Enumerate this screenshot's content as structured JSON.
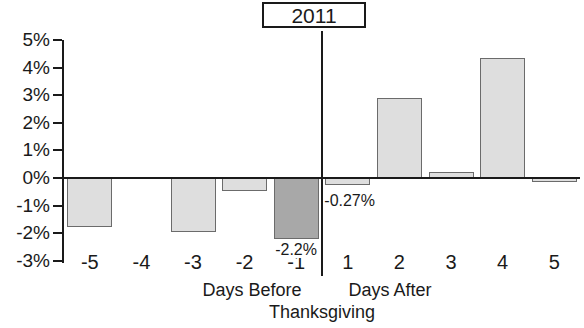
{
  "chart_data": {
    "type": "bar",
    "title": "2011",
    "xlabel": "Days Before Thanksgiving / Days After Thanksgiving",
    "ylabel": "",
    "ylim": [
      -3,
      5
    ],
    "ytick_labels": [
      "5%",
      "4%",
      "3%",
      "2%",
      "1%",
      "0%",
      "-1%",
      "-2%",
      "-3%"
    ],
    "ytick_values": [
      5,
      4,
      3,
      2,
      1,
      0,
      -1,
      -2,
      -3
    ],
    "grid": false,
    "legend": "none",
    "categories": [
      "-5",
      "-4",
      "-3",
      "-2",
      "-1",
      "1",
      "2",
      "3",
      "4",
      "5"
    ],
    "values": [
      -1.78,
      0.0,
      -1.95,
      -0.47,
      -2.2,
      -0.27,
      2.9,
      0.22,
      4.33,
      -0.15
    ],
    "annotations": [
      {
        "category": "-1",
        "text": "-2.2%"
      },
      {
        "category": "1",
        "text": "-0.27%"
      }
    ],
    "bar_colors": {
      "default": "#dedede",
      "highlight": "#a8a8a8"
    },
    "highlight_category": "-1",
    "axis_divider_after_category": "-1"
  },
  "axis_group_labels": {
    "before": "Days Before",
    "after": "Days After",
    "event": "Thanksgiving"
  },
  "colors": {
    "axis": "#1a1a1a",
    "bar_fill": "#dedede",
    "bar_fill_highlight": "#a8a8a8",
    "bar_stroke": "#6b6b6b",
    "background": "#ffffff"
  }
}
